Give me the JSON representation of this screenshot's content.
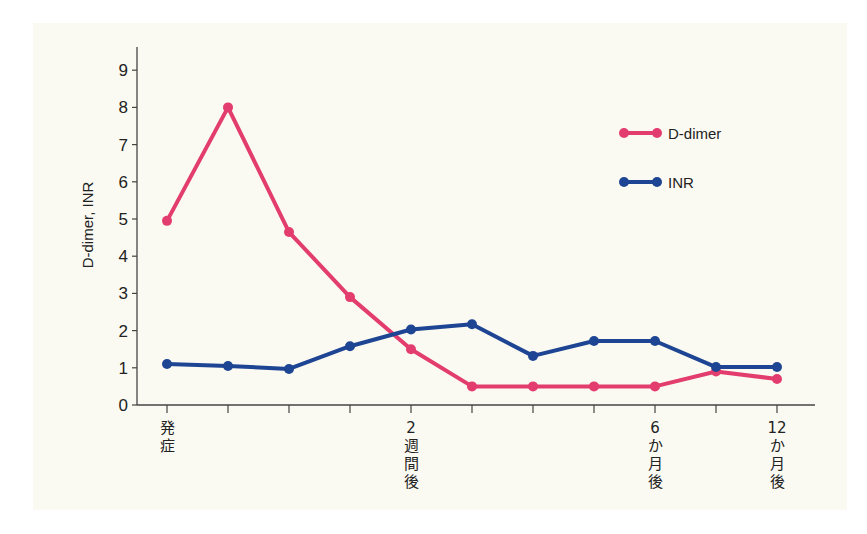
{
  "chart_data": {
    "type": "line",
    "title": "",
    "xlabel": "",
    "ylabel": "D-dimer, INR",
    "ylim": [
      0,
      9
    ],
    "yticks": [
      0,
      1,
      2,
      3,
      4,
      5,
      6,
      7,
      8,
      9
    ],
    "grid": false,
    "legend_position": "upper right",
    "categories": [
      "発症",
      "",
      "",
      "",
      "2週間後",
      "",
      "",
      "",
      "6か月後",
      "",
      "12か月後"
    ],
    "category_label_columns": {
      "0": [
        "発",
        "症"
      ],
      "4": [
        "2",
        "週",
        "間",
        "後"
      ],
      "8": [
        "6",
        "か",
        "月",
        "後"
      ],
      "10": [
        "12",
        "か",
        "月",
        "後"
      ]
    },
    "series": [
      {
        "name": "D-dimer",
        "color": "#e23d6e",
        "values": [
          4.95,
          8.0,
          4.65,
          2.9,
          1.5,
          0.5,
          0.5,
          0.5,
          0.5,
          0.9,
          0.7
        ]
      },
      {
        "name": "INR",
        "color": "#1e4593",
        "values": [
          1.1,
          1.05,
          0.97,
          1.58,
          2.03,
          2.17,
          1.32,
          1.72,
          1.72,
          1.02,
          1.02
        ]
      }
    ]
  },
  "layout": {
    "axis_x0": 137,
    "axis_y0": 405,
    "axis_top": 47,
    "axis_right": 815,
    "first_cat_x": 167,
    "cat_step": 61,
    "unit_px": 37.2
  }
}
